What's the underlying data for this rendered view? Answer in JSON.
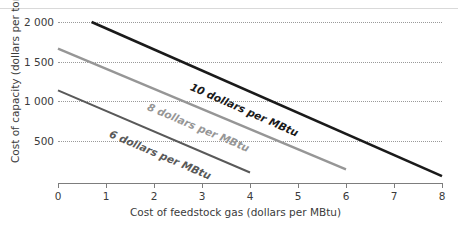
{
  "chart_data": {
    "type": "line",
    "title": "",
    "xlabel": "Cost of feedstock gas (dollars per MBtu)",
    "ylabel": "Cost of capacity (dollars per tonne)",
    "xlim": [
      0,
      8
    ],
    "ylim": [
      0,
      2100
    ],
    "xticks": [
      "0",
      "1",
      "2",
      "3",
      "4",
      "5",
      "6",
      "7",
      "8"
    ],
    "xtick_values": [
      0,
      1,
      2,
      3,
      4,
      5,
      6,
      7,
      8
    ],
    "yticks": [
      "500",
      "1 000",
      "1 500",
      "2 000"
    ],
    "ytick_values": [
      500,
      1000,
      1500,
      2000
    ],
    "grid": "horizontal-dotted",
    "legend": "inline-labels-on-lines",
    "series": [
      {
        "name": "6 dollars per MBtu",
        "label": "6 dollars per MBtu",
        "color": "#595959",
        "width": 2,
        "x": [
          0,
          4
        ],
        "y": [
          1150,
          130
        ]
      },
      {
        "name": "8 dollars per MBtu",
        "label": "8 dollars per MBtu",
        "color": "#969696",
        "width": 2.4,
        "x": [
          0,
          6
        ],
        "y": [
          1670,
          170
        ]
      },
      {
        "name": "10 dollars per MBtu",
        "label": "10 dollars per MBtu",
        "color": "#1a1a1a",
        "width": 2.6,
        "x": [
          0.7,
          8
        ],
        "y": [
          2000,
          85
        ]
      }
    ]
  },
  "axis": {
    "y_title": "Cost of capacity (dollars per tonne)",
    "x_title": "Cost of feedstock gas (dollars per MBtu)",
    "y_ticks": [
      "2 000",
      "1 500",
      "1 000",
      "500"
    ],
    "x_ticks": [
      "0",
      "1",
      "2",
      "3",
      "4",
      "5",
      "6",
      "7",
      "8"
    ]
  },
  "series_labels": {
    "six": "6 dollars per MBtu",
    "eight": "8 dollars per MBtu",
    "ten": "10 dollars per MBtu"
  },
  "colors": {
    "six": "#595959",
    "eight": "#969696",
    "ten": "#1a1a1a",
    "grid": "#9a9a9a",
    "axis": "#7d7d7d",
    "text": "#3b3b3b"
  },
  "clipped_title": ""
}
